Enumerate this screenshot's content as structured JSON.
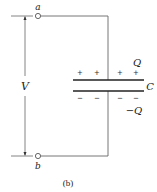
{
  "diagram": {
    "type": "capacitor-circuit",
    "terminals": [
      {
        "id": "a",
        "label": "a"
      },
      {
        "id": "b",
        "label": "b"
      }
    ],
    "voltage_label": "V",
    "capacitor": {
      "label": "C",
      "top_charge_label": "Q",
      "bottom_charge_label": "−Q",
      "top_signs": [
        "+",
        "+",
        "+",
        "+"
      ],
      "bottom_signs": [
        "−",
        "−",
        "−",
        "−"
      ]
    },
    "caption": "(b)",
    "colors": {
      "line": "#555555",
      "plate": "#222222",
      "text": "#222222"
    }
  }
}
